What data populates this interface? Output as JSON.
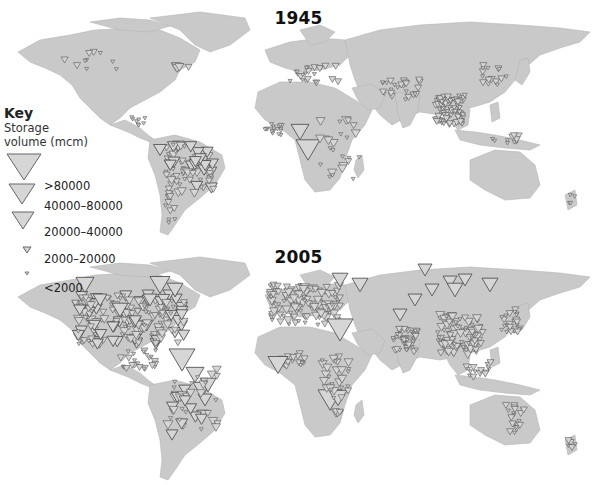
{
  "panels": [
    {
      "id": "1945",
      "title": "1945"
    },
    {
      "id": "2005",
      "title": "2005"
    }
  ],
  "key": {
    "title": "Key",
    "subtitle_line1": "Storage",
    "subtitle_line2": "volume (mcm)",
    "classes": [
      {
        "label": ">80000",
        "size": 22
      },
      {
        "label": "40000–80000",
        "size": 17
      },
      {
        "label": "20000–40000",
        "size": 13
      },
      {
        "label": "2000–20000",
        "size": 7
      },
      {
        "label": "<2000",
        "size": 4
      }
    ]
  },
  "colors": {
    "land": "#c9c9c9",
    "land_stroke": "#b5b5b5",
    "marker_fill": "#d6d6d6",
    "marker_stroke": "#555555",
    "background": "#ffffff"
  },
  "chart_data": {
    "type": "map",
    "legend": {
      "title": "Key – Storage volume (mcm)",
      "entries": [
        ">80000",
        "40000–80000",
        "20000–40000",
        "2000–20000",
        "<2000"
      ],
      "position": "left"
    },
    "maps": [
      {
        "year": "1945",
        "regions": [
          {
            "name": "North America",
            "density": "low",
            "max_class": "20000–40000"
          },
          {
            "name": "Central America",
            "density": "low",
            "max_class": "2000–20000"
          },
          {
            "name": "South America",
            "density": "high",
            "max_class": "40000–80000"
          },
          {
            "name": "Europe",
            "density": "medium",
            "max_class": "20000–40000"
          },
          {
            "name": "West Africa",
            "density": "medium",
            "max_class": "2000–20000"
          },
          {
            "name": "Central/East Africa",
            "density": "medium",
            "max_class": ">80000"
          },
          {
            "name": "Central Asia",
            "density": "medium",
            "max_class": "20000–40000"
          },
          {
            "name": "South/Southeast Asia",
            "density": "very high",
            "max_class": "20000–40000"
          },
          {
            "name": "East Asia",
            "density": "medium",
            "max_class": "20000–40000"
          },
          {
            "name": "Indonesia/Philippines",
            "density": "low",
            "max_class": "20000–40000"
          },
          {
            "name": "Australia",
            "density": "none",
            "max_class": ""
          },
          {
            "name": "New Zealand",
            "density": "low",
            "max_class": "2000–20000"
          }
        ]
      },
      {
        "year": "2005",
        "regions": [
          {
            "name": "North America",
            "density": "very high",
            "max_class": ">80000"
          },
          {
            "name": "Central America",
            "density": "medium",
            "max_class": "20000–40000"
          },
          {
            "name": "South America",
            "density": "high",
            "max_class": ">80000"
          },
          {
            "name": "Europe",
            "density": "very high",
            "max_class": "40000–80000"
          },
          {
            "name": "North/West Africa",
            "density": "medium",
            "max_class": ">80000"
          },
          {
            "name": "East/Southern Africa",
            "density": "high",
            "max_class": ">80000"
          },
          {
            "name": "Russia/Siberia",
            "density": "medium",
            "max_class": ">80000"
          },
          {
            "name": "Middle East",
            "density": "medium",
            "max_class": ">80000"
          },
          {
            "name": "India",
            "density": "very high",
            "max_class": "40000–80000"
          },
          {
            "name": "China",
            "density": "very high",
            "max_class": "40000–80000"
          },
          {
            "name": "Japan/Korea",
            "density": "high",
            "max_class": "20000–40000"
          },
          {
            "name": "Southeast Asia",
            "density": "medium",
            "max_class": "20000–40000"
          },
          {
            "name": "Australia",
            "density": "medium",
            "max_class": "20000–40000"
          },
          {
            "name": "New Zealand",
            "density": "low",
            "max_class": "20000–40000"
          }
        ]
      }
    ]
  }
}
